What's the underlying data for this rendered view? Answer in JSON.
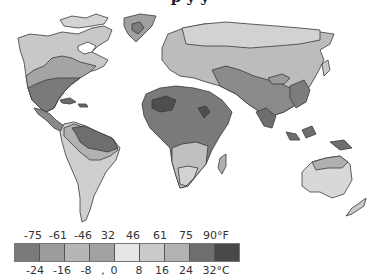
{
  "title_fragment": "p         y y",
  "map": {
    "subject": "world annual temperature zones",
    "colors": {
      "ocean": "#ffffff",
      "outline": "#3a3a3a",
      "z1": "#7a7a7a",
      "z2": "#9a9a9a",
      "z3": "#b4b4b4",
      "z4": "#a0a0a0",
      "z5": "#e4e4e4",
      "z6": "#c8c8c8",
      "z7": "#b0b0b0",
      "z8": "#6c6c6c",
      "z9": "#4a4a4a"
    }
  },
  "legend": {
    "fahrenheit": [
      "-75",
      "-61",
      "-46",
      "32",
      "46",
      "61",
      "75",
      "90°F"
    ],
    "celsius": [
      "-24",
      "-16",
      "-8",
      ",",
      "0",
      "8",
      "16",
      "24",
      "32°C"
    ],
    "swatches": [
      "#7a7a7a",
      "#9c9c9c",
      "#b6b6b6",
      "#a2a2a2",
      "#e6e6e6",
      "#cacaca",
      "#b2b2b2",
      "#6e6e6e",
      "#484848"
    ]
  }
}
